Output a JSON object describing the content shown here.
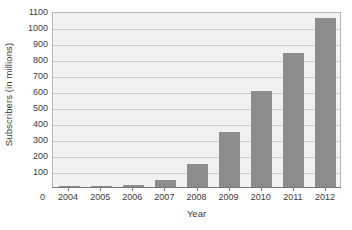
{
  "chart_data": {
    "type": "bar",
    "title": "",
    "xlabel": "Year",
    "ylabel": "Subscribers (in millions)",
    "categories": [
      "2004",
      "2005",
      "2006",
      "2007",
      "2008",
      "2009",
      "2010",
      "2011",
      "2012"
    ],
    "values": [
      2,
      4,
      11,
      46,
      141,
      342,
      602,
      840,
      1056
    ],
    "series": [
      {
        "name": "Subscribers (in millions)",
        "values": [
          2,
          4,
          11,
          46,
          141,
          342,
          602,
          840,
          1056
        ]
      }
    ],
    "ylim": [
      0,
      1100
    ],
    "ytick_values": [
      100,
      200,
      300,
      400,
      500,
      600,
      700,
      800,
      900,
      1000,
      1100
    ],
    "ytick_labels": [
      "100",
      "200",
      "300",
      "400",
      "500",
      "600",
      "700",
      "800",
      "900",
      "1000",
      "1100"
    ],
    "x_origin_label": "0",
    "grid": "horizontal",
    "legend": "none",
    "bar_color": "#8d8d8d",
    "plot_background": "#f2f2f2",
    "gridline_color": "#c9c9c9",
    "axis_color": "#777777"
  }
}
